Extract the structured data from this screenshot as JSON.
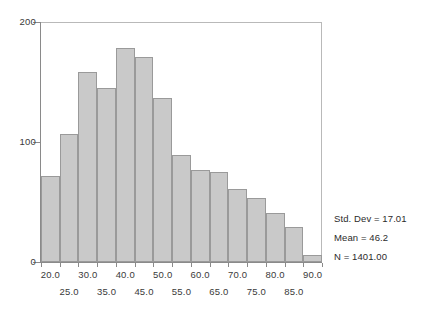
{
  "chart_data": {
    "type": "bar",
    "chart_subtype": "histogram",
    "title": "",
    "xlabel": "",
    "ylabel": "",
    "ylim": [
      0,
      200
    ],
    "xlim": [
      17.5,
      92.5
    ],
    "grid": false,
    "legend": null,
    "bin_width": 5,
    "bar_color": "#c9c9c9",
    "bar_edge_color": "#9a9a9a",
    "categories": [
      "17.5-22.5",
      "22.5-27.5",
      "27.5-32.5",
      "32.5-37.5",
      "37.5-42.5",
      "42.5-47.5",
      "47.5-52.5",
      "52.5-57.5",
      "57.5-62.5",
      "62.5-67.5",
      "67.5-72.5",
      "72.5-77.5",
      "77.5-82.5",
      "82.5-87.5",
      "87.5-92.5"
    ],
    "bin_centers": [
      20,
      25,
      30,
      35,
      40,
      45,
      50,
      55,
      60,
      65,
      70,
      75,
      80,
      85,
      90
    ],
    "values": [
      72,
      107,
      158,
      145,
      178,
      171,
      137,
      89,
      77,
      75,
      61,
      53,
      41,
      29,
      6
    ],
    "yticks": [
      0,
      100,
      200
    ],
    "ytick_labels": [
      "0",
      "100",
      "200"
    ],
    "xticks_upper": [
      20.0,
      30.0,
      40.0,
      50.0,
      60.0,
      70.0,
      80.0,
      90.0
    ],
    "xtick_labels_upper": [
      "20.0",
      "30.0",
      "40.0",
      "50.0",
      "60.0",
      "70.0",
      "80.0",
      "90.0"
    ],
    "xticks_lower": [
      25.0,
      35.0,
      45.0,
      55.0,
      65.0,
      75.0,
      85.0
    ],
    "xtick_labels_lower": [
      "25.0",
      "35.0",
      "45.0",
      "55.0",
      "65.0",
      "75.0",
      "85.0"
    ],
    "annotations": [
      "Std. Dev = 17.01",
      "Mean = 46.2",
      "N = 1401.00"
    ]
  },
  "stats": {
    "std_dev": "Std. Dev = 17.01",
    "mean": "Mean = 46.2",
    "n": "N = 1401.00"
  }
}
